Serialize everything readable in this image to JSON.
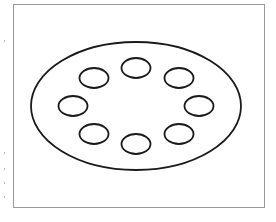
{
  "diagram": {
    "stroke_color": "#1a1a1a",
    "frame_color": "#9a9a9a",
    "background": "#ffffff",
    "outer_ellipse": {
      "cx": 136,
      "cy": 106,
      "rx": 105,
      "ry": 64
    },
    "inner_ellipses": [
      {
        "position": "top",
        "cx": 136,
        "cy": 68,
        "rx": 14.5,
        "ry": 10
      },
      {
        "position": "upper-right",
        "cx": 179,
        "cy": 78,
        "rx": 14.5,
        "ry": 10
      },
      {
        "position": "right",
        "cx": 199,
        "cy": 106,
        "rx": 14.5,
        "ry": 10
      },
      {
        "position": "lower-right",
        "cx": 179,
        "cy": 134,
        "rx": 14.5,
        "ry": 10
      },
      {
        "position": "bottom",
        "cx": 136,
        "cy": 144,
        "rx": 14.5,
        "ry": 10
      },
      {
        "position": "lower-left",
        "cx": 94,
        "cy": 134,
        "rx": 14.5,
        "ry": 10
      },
      {
        "position": "left",
        "cx": 73,
        "cy": 106,
        "rx": 14.5,
        "ry": 10
      },
      {
        "position": "upper-left",
        "cx": 94,
        "cy": 78,
        "rx": 14.5,
        "ry": 10
      }
    ],
    "inner_count": 8
  }
}
